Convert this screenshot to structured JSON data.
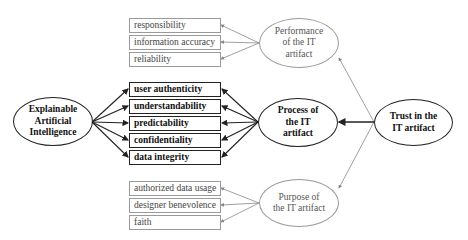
{
  "diagram": {
    "nodes": {
      "xai": {
        "label": "Explainable\nArtificial\nIntelligence"
      },
      "performance": {
        "label": "Performance\nof the IT\nartifact"
      },
      "process": {
        "label": "Process of\nthe IT\nartifact"
      },
      "purpose": {
        "label": "Purpose of\nthe IT artifact"
      },
      "trust": {
        "label": "Trust in the\nIT artifact"
      }
    },
    "performance_items": [
      "responsibility",
      "information accuracy",
      "reliability"
    ],
    "process_items": [
      "user authenticity",
      "understandability",
      "predictability",
      "confidentiality",
      "data integrity"
    ],
    "purpose_items": [
      "authorized data usage",
      "designer benevolence",
      "faith"
    ],
    "edges": [
      {
        "from": "trust",
        "to": "performance",
        "style": "light"
      },
      {
        "from": "trust",
        "to": "process",
        "style": "bold"
      },
      {
        "from": "trust",
        "to": "purpose",
        "style": "light"
      },
      {
        "from": "performance",
        "to": "performance_items",
        "style": "light"
      },
      {
        "from": "process",
        "to": "process_items",
        "style": "bold"
      },
      {
        "from": "xai",
        "to": "process_items",
        "style": "bold"
      },
      {
        "from": "purpose",
        "to": "purpose_items",
        "style": "light"
      }
    ],
    "colors": {
      "bold_stroke": "#222222",
      "light_stroke": "#9a9a9a"
    }
  }
}
